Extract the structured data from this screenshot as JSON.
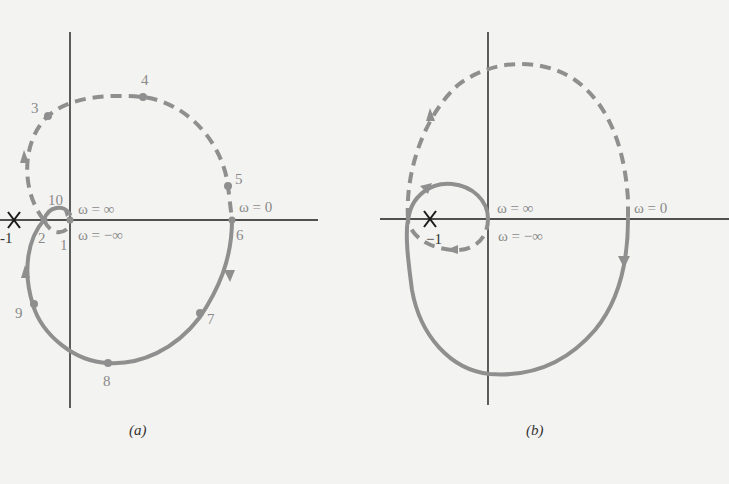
{
  "figure": {
    "panels": [
      {
        "id": "a",
        "caption": "(a)",
        "critical_point_label": "-1",
        "omega_labels": {
          "plus_inf": "ω = ∞",
          "zero": "ω = 0",
          "minus_inf": "ω = −∞"
        },
        "point_labels": [
          "1",
          "2",
          "3",
          "4",
          "5",
          "6",
          "7",
          "8",
          "9",
          "10"
        ]
      },
      {
        "id": "b",
        "caption": "(b)",
        "critical_point_label": "−1",
        "omega_labels": {
          "plus_inf": "ω = ∞",
          "zero": "ω = 0",
          "minus_inf": "ω = −∞"
        }
      }
    ],
    "colors": {
      "curve": "#8f8f8f",
      "axis": "#1a1a1a",
      "background": "#f3f3f1"
    }
  }
}
